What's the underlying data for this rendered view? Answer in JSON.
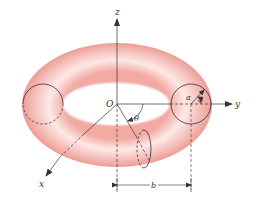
{
  "diagram": {
    "colors": {
      "torus_fill_light": "#fde8e6",
      "torus_fill_dark": "#f0a8a2",
      "line": "#333333",
      "background": "#ffffff"
    },
    "labels": {
      "z_axis": "z",
      "y_axis": "y",
      "x_axis": "x",
      "origin": "O",
      "theta": "θ",
      "phi": "φ",
      "minor_radius": "a",
      "major_radius": "b"
    }
  }
}
